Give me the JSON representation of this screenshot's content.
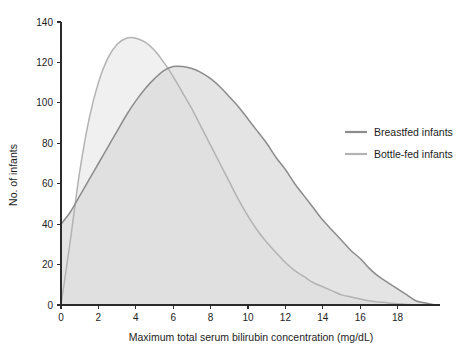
{
  "chart_data": {
    "type": "line",
    "title": "",
    "xlabel": "Maximum total serum bilirubin concentration (mg/dL)",
    "ylabel": "No. of infants",
    "xlim": [
      0,
      20
    ],
    "ylim": [
      0,
      140
    ],
    "xticks": [
      0,
      2,
      4,
      6,
      8,
      10,
      12,
      14,
      16,
      18
    ],
    "yticks": [
      0,
      20,
      40,
      60,
      80,
      100,
      120,
      140
    ],
    "xtick_labels": [
      "0",
      "2",
      "4",
      "6",
      "8",
      "10",
      "12",
      "14",
      "16",
      "18"
    ],
    "ytick_labels": [
      "0",
      "20",
      "40",
      "60",
      "80",
      "100",
      "120",
      "140"
    ],
    "grid": false,
    "legend_position": "right",
    "filled": true,
    "x": [
      0,
      0.5,
      1,
      1.5,
      2,
      2.5,
      3,
      3.5,
      4,
      4.5,
      5,
      5.5,
      6,
      6.5,
      7,
      7.5,
      8,
      8.5,
      9,
      9.5,
      10,
      10.5,
      11,
      11.5,
      12,
      12.5,
      13,
      13.5,
      14,
      14.5,
      15,
      15.5,
      16,
      16.5,
      17,
      17.5,
      18,
      18.5,
      19,
      19.5,
      20
    ],
    "series": [
      {
        "name": "Breastfed infants",
        "color": "#8c8c8c",
        "fill": "#d9d9d9",
        "values": [
          40,
          46,
          54,
          62,
          70,
          78,
          86,
          94,
          101,
          107,
          112,
          116,
          118,
          118,
          117,
          115,
          112,
          108,
          103,
          98,
          92,
          86,
          80,
          73,
          67,
          60,
          54,
          48,
          42,
          37,
          32,
          27,
          23,
          18,
          14,
          11,
          8,
          5,
          2,
          1,
          0
        ]
      },
      {
        "name": "Bottle-fed infants",
        "color": "#b3b3b3",
        "fill": "#eaeaea",
        "values": [
          0,
          32,
          66,
          92,
          110,
          122,
          129,
          132,
          132,
          130,
          126,
          120,
          113,
          105,
          97,
          88,
          79,
          70,
          61,
          52,
          44,
          37,
          31,
          26,
          21,
          17,
          14,
          11,
          9,
          7,
          5,
          4,
          3,
          2,
          1.5,
          1,
          0.6,
          0.3,
          0.1,
          0,
          0
        ]
      }
    ],
    "legend": [
      {
        "label": "Breastfed infants",
        "color": "#8c8c8c"
      },
      {
        "label": "Bottle-fed infants",
        "color": "#b3b3b3"
      }
    ]
  }
}
